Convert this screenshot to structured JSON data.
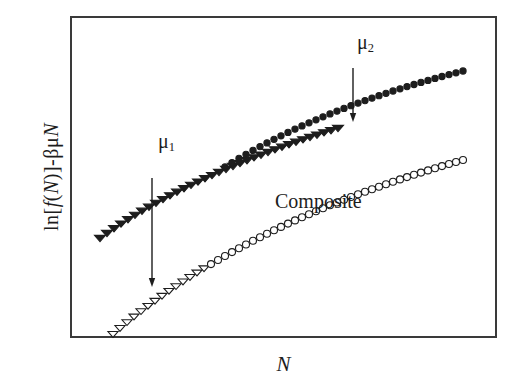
{
  "figure": {
    "background_color": "#ffffff",
    "frame_color": "#3a3a3a",
    "ink_color": "#1d1d1d"
  },
  "axes": {
    "y_label_parts": {
      "prefix": "ln[",
      "f": "f",
      "open": "(",
      "N": "N",
      "close": ")",
      "bracket": "]",
      "minus": " - ",
      "beta_mu": "βμ",
      "N2": "N"
    },
    "y_label_text": "ln[f(N)] - βμN",
    "x_label": "N",
    "ticks_visible": false,
    "grid": false
  },
  "annotations": {
    "mu1_label": "μ",
    "mu1_sub": "1",
    "mu2_label": "μ",
    "mu2_sub": "2",
    "composite_label": "Composite",
    "arrows": [
      {
        "name": "arrow-mu1-to-composite",
        "x": 152,
        "y_start": 178,
        "y_end": 287,
        "direction": "down"
      },
      {
        "name": "arrow-mu2-to-composite",
        "x": 353,
        "y_start": 68,
        "y_end": 122,
        "direction": "down"
      }
    ]
  },
  "chart_data": {
    "type": "scatter",
    "title": "",
    "xlabel": "N",
    "ylabel": "ln[f(N)] - βμN",
    "xlim": [
      0,
      1
    ],
    "ylim": [
      0,
      1
    ],
    "grid": false,
    "legend_position": "in-plot annotations",
    "axis_ticks": "none",
    "note": "Schematic free-energy-like curves: two single-component branches (μ1, μ2) lying above a lower composite branch; vertical arrows map each branch down onto the composite curve.",
    "series": [
      {
        "name": "μ1",
        "marker": "filled-triangle-down",
        "marker_size": 7,
        "color": "#1d1d1d",
        "fill": "#1d1d1d",
        "points": [
          [
            100.0,
            238.0
          ],
          [
            107.0,
            233.0
          ],
          [
            114.0,
            228.2
          ],
          [
            121.0,
            223.6
          ],
          [
            128.0,
            219.2
          ],
          [
            135.0,
            214.9
          ],
          [
            142.0,
            210.8
          ],
          [
            149.0,
            206.8
          ],
          [
            156.0,
            202.9
          ],
          [
            163.0,
            199.1
          ],
          [
            170.0,
            195.4
          ],
          [
            177.0,
            191.8
          ],
          [
            184.0,
            188.3
          ],
          [
            191.0,
            184.9
          ],
          [
            198.0,
            181.6
          ],
          [
            205.0,
            178.3
          ],
          [
            212.0,
            175.1
          ],
          [
            219.0,
            172.0
          ],
          [
            226.0,
            169.0
          ],
          [
            233.0,
            166.0
          ],
          [
            240.0,
            163.1
          ],
          [
            247.0,
            160.2
          ],
          [
            254.0,
            157.4
          ],
          [
            261.0,
            154.7
          ],
          [
            268.0,
            152.0
          ],
          [
            275.0,
            149.4
          ],
          [
            282.0,
            146.8
          ],
          [
            289.0,
            144.3
          ],
          [
            296.0,
            141.8
          ],
          [
            303.0,
            139.4
          ],
          [
            310.0,
            137.0
          ],
          [
            317.0,
            134.7
          ],
          [
            324.0,
            132.4
          ],
          [
            331.0,
            130.2
          ],
          [
            338.0,
            128.0
          ]
        ]
      },
      {
        "name": "μ2",
        "marker": "filled-circle",
        "marker_size": 6,
        "color": "#1d1d1d",
        "fill": "#1d1d1d",
        "points": [
          [
            225.0,
            167.0
          ],
          [
            232.0,
            162.6
          ],
          [
            239.0,
            158.4
          ],
          [
            246.0,
            154.3
          ],
          [
            253.0,
            150.4
          ],
          [
            260.0,
            146.6
          ],
          [
            267.0,
            142.9
          ],
          [
            274.0,
            139.3
          ],
          [
            281.0,
            135.8
          ],
          [
            288.0,
            132.4
          ],
          [
            295.0,
            129.1
          ],
          [
            302.0,
            125.9
          ],
          [
            309.0,
            122.8
          ],
          [
            316.0,
            119.8
          ],
          [
            323.0,
            116.8
          ],
          [
            330.0,
            113.9
          ],
          [
            337.0,
            111.1
          ],
          [
            344.0,
            108.4
          ],
          [
            351.0,
            105.7
          ],
          [
            358.0,
            103.1
          ],
          [
            365.0,
            100.6
          ],
          [
            372.0,
            98.1
          ],
          [
            379.0,
            95.7
          ],
          [
            386.0,
            93.3
          ],
          [
            393.0,
            91.0
          ],
          [
            400.0,
            88.8
          ],
          [
            407.0,
            86.6
          ],
          [
            414.0,
            84.5
          ],
          [
            421.0,
            82.4
          ],
          [
            428.0,
            80.4
          ],
          [
            435.0,
            78.4
          ],
          [
            442.0,
            76.5
          ],
          [
            449.0,
            74.6
          ],
          [
            456.0,
            72.8
          ],
          [
            463.0,
            71.0
          ]
        ]
      },
      {
        "name": "Composite",
        "marker": "open-triangle-down-then-open-circle",
        "marker_size": 7,
        "color": "#1d1d1d",
        "fill": "#ffffff",
        "points": [
          [
            113.0,
            334.0
          ],
          [
            120.0,
            328.0
          ],
          [
            127.0,
            322.2
          ],
          [
            134.0,
            316.6
          ],
          [
            141.0,
            311.2
          ],
          [
            148.0,
            305.9
          ],
          [
            155.0,
            300.8
          ],
          [
            162.0,
            295.8
          ],
          [
            169.0,
            290.9
          ],
          [
            176.0,
            286.2
          ],
          [
            183.0,
            281.5
          ],
          [
            190.0,
            277.0
          ],
          [
            197.0,
            272.6
          ],
          [
            204.0,
            268.3
          ],
          [
            211.0,
            264.1
          ],
          [
            218.0,
            260.0
          ],
          [
            225.0,
            256.0
          ],
          [
            232.0,
            252.1
          ],
          [
            239.0,
            248.2
          ],
          [
            246.0,
            244.5
          ],
          [
            253.0,
            240.8
          ],
          [
            260.0,
            237.2
          ],
          [
            267.0,
            233.7
          ],
          [
            274.0,
            230.3
          ],
          [
            281.0,
            226.9
          ],
          [
            288.0,
            223.6
          ],
          [
            295.0,
            220.4
          ],
          [
            302.0,
            217.3
          ],
          [
            309.0,
            214.2
          ],
          [
            316.0,
            211.2
          ],
          [
            323.0,
            208.2
          ],
          [
            330.0,
            205.3
          ],
          [
            337.0,
            202.5
          ],
          [
            344.0,
            199.7
          ],
          [
            351.0,
            197.0
          ],
          [
            358.0,
            194.3
          ],
          [
            365.0,
            191.7
          ],
          [
            372.0,
            189.2
          ],
          [
            379.0,
            186.7
          ],
          [
            386.0,
            184.2
          ],
          [
            393.0,
            181.8
          ],
          [
            400.0,
            179.4
          ],
          [
            407.0,
            177.1
          ],
          [
            414.0,
            174.8
          ],
          [
            421.0,
            172.6
          ],
          [
            428.0,
            170.4
          ],
          [
            435.0,
            168.2
          ],
          [
            442.0,
            166.1
          ],
          [
            449.0,
            164.0
          ],
          [
            456.0,
            162.0
          ],
          [
            463.0,
            160.0
          ]
        ],
        "open_marker_switch_index": 14
      }
    ]
  }
}
